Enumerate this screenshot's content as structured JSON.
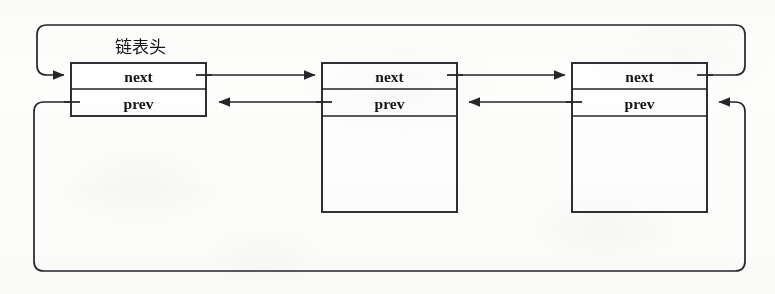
{
  "diagram": {
    "title": "链表头",
    "type": "circular-doubly-linked-list",
    "background_color": "#fdfdfc",
    "ink_color": "#25252a",
    "text_color": "#16161a",
    "head_label": "链表头",
    "field_labels": {
      "next": "next",
      "prev": "prev"
    },
    "nodes": [
      {
        "id": "node-head",
        "role": "head",
        "label": "链表头",
        "fields": [
          {
            "name": "next",
            "text": "next"
          },
          {
            "name": "prev",
            "text": "prev"
          }
        ]
      },
      {
        "id": "node-second",
        "role": "element",
        "label": "",
        "fields": [
          {
            "name": "next",
            "text": "next"
          },
          {
            "name": "prev",
            "text": "prev"
          }
        ]
      },
      {
        "id": "node-third",
        "role": "element",
        "label": "",
        "fields": [
          {
            "name": "next",
            "text": "next"
          },
          {
            "name": "prev",
            "text": "prev"
          }
        ]
      }
    ],
    "links": [
      {
        "name": "head-next-to-second",
        "from": "node-head.next",
        "to": "node-second",
        "direction": "right"
      },
      {
        "name": "second-next-to-third",
        "from": "node-second.next",
        "to": "node-third",
        "direction": "right"
      },
      {
        "name": "third-next-wrap-to-head",
        "from": "node-third.next",
        "to": "node-head",
        "direction": "wrap-top"
      },
      {
        "name": "second-prev-to-head",
        "from": "node-second.prev",
        "to": "node-head",
        "direction": "left"
      },
      {
        "name": "third-prev-to-second",
        "from": "node-third.prev",
        "to": "node-second",
        "direction": "left"
      },
      {
        "name": "head-prev-wrap-to-third",
        "from": "node-head.prev",
        "to": "node-third",
        "direction": "wrap-bottom"
      }
    ]
  }
}
